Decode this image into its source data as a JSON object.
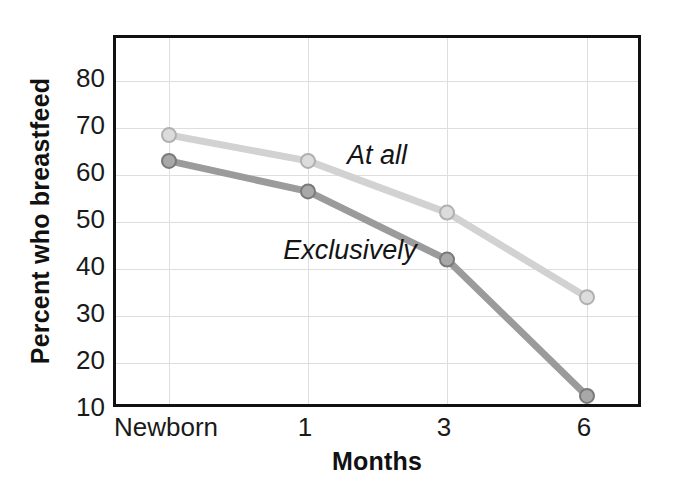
{
  "chart_data": {
    "type": "line",
    "title": "",
    "xlabel": "Months",
    "ylabel": "Percent who breastfeed",
    "categories": [
      "Newborn",
      "1",
      "3",
      "6"
    ],
    "yticks": [
      80,
      70,
      60,
      50,
      40,
      30,
      20,
      10
    ],
    "ylim": [
      10,
      85
    ],
    "grid": true,
    "legend_position": "inline-annotations",
    "series": [
      {
        "name": "At all",
        "values": [
          68.5,
          63,
          52,
          34
        ],
        "color": "#d2d2d2",
        "marker_fill": "#dcdcdc",
        "marker_stroke": "#b0b0b0"
      },
      {
        "name": "Exclusively",
        "values": [
          63,
          56.5,
          42,
          13
        ],
        "color": "#9b9b9b",
        "marker_fill": "#a8a8a8",
        "marker_stroke": "#7a7a7a"
      }
    ],
    "annotations": [
      {
        "text": "At all",
        "x_px": 377,
        "y_px": 155
      },
      {
        "text": "Exclusively",
        "x_px": 350,
        "y_px": 250
      }
    ],
    "frame_color": "#111111",
    "grid_color": "#dedede"
  }
}
